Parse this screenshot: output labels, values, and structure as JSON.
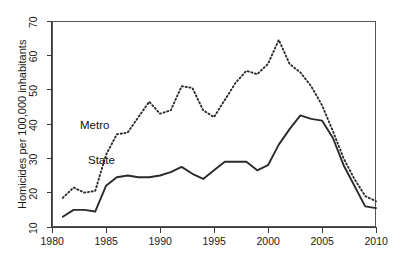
{
  "chart_data": {
    "type": "line",
    "title": "",
    "subtitle": "",
    "xlabel": "",
    "ylabel": "Homicides per 100,000 inhabitants",
    "xlim": [
      1980,
      2010
    ],
    "ylim": [
      10,
      70
    ],
    "xticks": [
      1980,
      1985,
      1990,
      1995,
      2000,
      2005,
      2010
    ],
    "yticks": [
      10,
      20,
      30,
      40,
      50,
      60,
      70
    ],
    "grid": false,
    "legend_position": "inline-annotations",
    "x": [
      1981,
      1982,
      1983,
      1984,
      1985,
      1986,
      1987,
      1988,
      1989,
      1990,
      1991,
      1992,
      1993,
      1994,
      1995,
      1996,
      1997,
      1998,
      1999,
      2000,
      2001,
      2002,
      2003,
      2004,
      2005,
      2006,
      2007,
      2008,
      2009,
      2010
    ],
    "series": [
      {
        "name": "Metro",
        "style": "dotted",
        "values": [
          18.5,
          21.5,
          20.0,
          20.5,
          31.0,
          37.0,
          37.5,
          42.0,
          46.5,
          43.0,
          44.0,
          51.0,
          50.5,
          44.0,
          42.0,
          47.0,
          52.0,
          55.5,
          54.5,
          57.5,
          64.5,
          57.5,
          55.0,
          51.0,
          45.5,
          38.0,
          30.0,
          24.0,
          19.0,
          17.5
        ]
      },
      {
        "name": "State",
        "style": "solid",
        "values": [
          13.0,
          15.0,
          15.0,
          14.5,
          22.0,
          24.5,
          25.0,
          24.5,
          24.5,
          25.0,
          26.0,
          27.5,
          25.5,
          24.0,
          26.5,
          29.0,
          29.0,
          29.0,
          26.5,
          28.0,
          34.0,
          38.5,
          42.5,
          41.5,
          41.0,
          36.0,
          28.0,
          22.0,
          16.0,
          15.5
        ]
      }
    ],
    "annotations": [
      {
        "text": "Metro",
        "x_px": 80,
        "y_px": 119
      },
      {
        "text": "State",
        "x_px": 88,
        "y_px": 154
      }
    ]
  },
  "axis": {
    "y_title": "Homicides per 100,000 inhabitants",
    "x_tick_labels": [
      "1980",
      "1985",
      "1990",
      "1995",
      "2000",
      "2005",
      "2010"
    ],
    "y_tick_labels": [
      "10",
      "20",
      "30",
      "40",
      "50",
      "60",
      "70"
    ]
  },
  "colors": {
    "line": "#2b2b2b",
    "axis": "#3a3a3a",
    "background": "#ffffff"
  }
}
